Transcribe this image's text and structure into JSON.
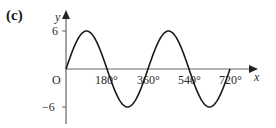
{
  "figure": {
    "part_label": "(c)"
  },
  "chart_data": {
    "type": "line",
    "title": "",
    "function": "y = 6 sin x",
    "xlabel": "x",
    "ylabel": "y",
    "origin_label": "O",
    "xlim": [
      0,
      720
    ],
    "ylim": [
      -6,
      6
    ],
    "x_ticks": [
      180,
      360,
      540,
      720
    ],
    "x_tick_labels": [
      "180°",
      "360°",
      "540°",
      "720°"
    ],
    "y_ticks": [
      6,
      -6
    ],
    "y_tick_labels": [
      "6",
      "−6"
    ],
    "grid": false,
    "legend": null,
    "series": [
      {
        "name": "y = 6 sin x",
        "x": [
          0,
          90,
          180,
          270,
          360,
          450,
          540,
          630,
          720
        ],
        "values": [
          0,
          6,
          0,
          -6,
          0,
          6,
          0,
          -6,
          0
        ]
      }
    ],
    "colors": {
      "curve": "#1a1a1a",
      "axes": "#555555"
    }
  }
}
